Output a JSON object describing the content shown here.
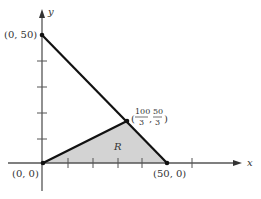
{
  "diagram": {
    "axes": {
      "x_label": "x",
      "y_label": "y"
    },
    "region": {
      "label": "R",
      "fill": "#d3d3d3"
    },
    "points": {
      "origin": "(0, 0)",
      "y_intercept": "(0, 50)",
      "x_intercept": "(50, 0)",
      "intersection": {
        "open": "(",
        "x_num": "100",
        "x_den": "3",
        "comma": ",",
        "y_num": "50",
        "y_den": "3",
        "close": ")"
      }
    },
    "colors": {
      "line": "#111111",
      "axis": "#444444",
      "text": "#333333"
    }
  }
}
